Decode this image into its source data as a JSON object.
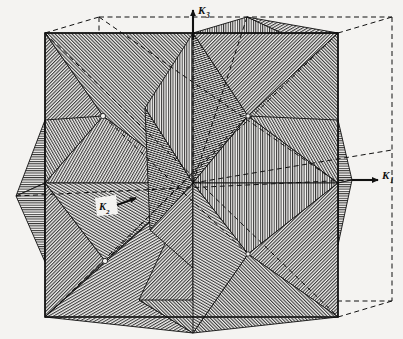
{
  "figure": {
    "kind": "line-engraving",
    "background_color": "#f4f3f1",
    "ink_color": "#101010",
    "paper_tone": "#eceae6",
    "canvas": {
      "width": 403,
      "height": 339
    }
  },
  "axes": [
    {
      "id": "k3",
      "label": "K",
      "subscript": "3",
      "direction": "up",
      "label_x": 200,
      "label_y": 13,
      "arrow_from_x": 193,
      "arrow_from_y": 40,
      "arrow_to_x": 193,
      "arrow_to_y": 8,
      "color": "#101010",
      "style": "solid-with-arrowhead"
    },
    {
      "id": "k1",
      "label": "K",
      "subscript": "1",
      "direction": "right",
      "label_x": 384,
      "label_y": 178,
      "arrow_from_x": 352,
      "arrow_from_y": 180,
      "arrow_to_x": 380,
      "arrow_to_y": 180,
      "color": "#101010",
      "style": "solid-with-arrowhead"
    },
    {
      "id": "k2",
      "label": "K",
      "subscript": "2",
      "direction": "toward-viewer-lower-left",
      "label_x": 100,
      "label_y": 207,
      "arrow_from_x": 133,
      "arrow_from_y": 200,
      "arrow_to_x": 113,
      "arrow_to_y": 207,
      "color": "#101010",
      "style": "solid-with-arrowhead-on-white-patch"
    }
  ],
  "cube": {
    "name": "outer-cube-wireframe",
    "front_face": {
      "x": 45,
      "y": 33,
      "width": 293,
      "height": 284
    },
    "depth_dx": 54,
    "depth_dy": -16,
    "edge_color": "#101010",
    "hidden_edge_style": "dashed"
  },
  "origin": {
    "x": 193,
    "y": 183
  },
  "star_tips": [
    {
      "id": "tip-right",
      "x": 352,
      "y": 180
    },
    {
      "id": "tip-left",
      "x": 16,
      "y": 196
    },
    {
      "id": "tip-top",
      "x": 193,
      "y": 33
    },
    {
      "id": "tip-bottom",
      "x": 193,
      "y": 333
    },
    {
      "id": "tip-back",
      "x": 247,
      "y": 17
    },
    {
      "id": "tip-front",
      "x": 139,
      "y": 300
    }
  ],
  "vertex_markers": [
    {
      "id": "vertex-upper-left",
      "x": 103,
      "y": 116,
      "marker": "white-node"
    },
    {
      "id": "vertex-lower-left",
      "x": 105,
      "y": 261,
      "marker": "white-node"
    },
    {
      "id": "vertex-upper-right",
      "x": 248,
      "y": 116,
      "marker": "white-node"
    },
    {
      "id": "vertex-lower-right",
      "x": 248,
      "y": 254,
      "marker": "white-node"
    }
  ],
  "hatching": {
    "description": "Parallel ruled line shading; angle varies per facet to distinguish orientation",
    "angles_deg": [
      0,
      30,
      45,
      60,
      90,
      120,
      135,
      150
    ],
    "spacing_px": 2.2,
    "line_width_px": 0.8
  },
  "caption": ""
}
